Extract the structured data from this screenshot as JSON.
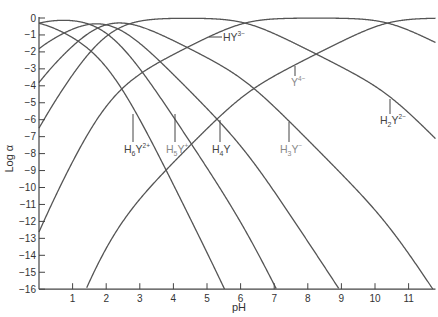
{
  "chart_data": {
    "type": "line",
    "title": "",
    "xlabel": "pH",
    "ylabel": "Log α",
    "xlim": [
      0,
      11.8
    ],
    "ylim": [
      -16,
      0
    ],
    "x_ticks": [
      1,
      2,
      3,
      4,
      5,
      6,
      7,
      8,
      9,
      10,
      11
    ],
    "y_ticks": [
      0,
      -1,
      -2,
      -3,
      -4,
      -5,
      -6,
      -7,
      -8,
      -9,
      -10,
      -11,
      -12,
      -13,
      -14,
      -15,
      -16
    ],
    "grid": false,
    "legend": "inline labels",
    "pKa": [
      0.0,
      1.5,
      2.0,
      2.69,
      6.13,
      10.37
    ],
    "series": [
      {
        "name": "H6Y2+",
        "label": "H₆Y²⁺",
        "n": 6
      },
      {
        "name": "H5Y+",
        "label": "H₅Y⁺",
        "n": 5
      },
      {
        "name": "H4Y",
        "label": "H₄Y",
        "n": 4
      },
      {
        "name": "H3Y-",
        "label": "H₃Y⁻",
        "n": 3
      },
      {
        "name": "H2Y2-",
        "label": "H₂Y²⁻",
        "n": 2
      },
      {
        "name": "HY3-",
        "label": "HY³⁻",
        "n": 1
      },
      {
        "name": "Y4-",
        "label": "Y⁴⁻",
        "n": 0
      }
    ],
    "annotations": [
      {
        "text": "H6Y2+",
        "x": 3.0,
        "y": -6.6
      },
      {
        "text": "H5Y+",
        "x": 4.0,
        "y": -6.6
      },
      {
        "text": "H4Y",
        "x": 5.0,
        "y": -6.6
      },
      {
        "text": "H3Y-",
        "x": 7.3,
        "y": -6.6
      },
      {
        "text": "Y4-",
        "x": 7.4,
        "y": -3.9
      },
      {
        "text": "H2Y2-",
        "x": 10.4,
        "y": -5.9
      },
      {
        "text": "HY3-",
        "x": 5.2,
        "y": -0.9
      }
    ]
  },
  "labels": {
    "xlabel": "pH",
    "ylabel": "Log α"
  }
}
